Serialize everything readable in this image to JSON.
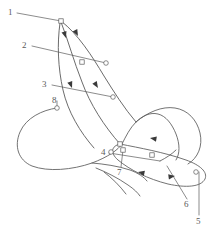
{
  "figure": {
    "kind": "scientific-line-diagram",
    "width": 220,
    "height": 236,
    "background_color": "#ffffff",
    "stroke_color": "#5a5a5a",
    "node_fill_color": "#ffffff",
    "arrow_fill_color": "#3a3a3a"
  },
  "callouts": [
    {
      "id": "1",
      "label": "1",
      "x": 8,
      "y": 8,
      "leader": "M 17 13 L 61 21"
    },
    {
      "id": "2",
      "label": "2",
      "x": 22,
      "y": 41,
      "leader": "M 32 46 L 106 63"
    },
    {
      "id": "3",
      "label": "3",
      "x": 42,
      "y": 80,
      "leader": "M 52 85 L 113 97"
    },
    {
      "id": "8",
      "label": "8",
      "x": 52,
      "y": 96,
      "leader": "M 57 101 L 57 108"
    },
    {
      "id": "4",
      "label": "4",
      "x": 101,
      "y": 148,
      "leader": "M 109 153 L 160 161"
    },
    {
      "id": "7",
      "label": "7",
      "x": 117,
      "y": 168,
      "leader": "M 121 167 L 123 150"
    },
    {
      "id": "6",
      "label": "6",
      "x": 184,
      "y": 200,
      "leader": "M 187 199 L 167 166"
    },
    {
      "id": "5",
      "label": "5",
      "x": 196,
      "y": 217,
      "leader": "M 199 215 L 199 172"
    }
  ],
  "paths": {
    "stroke_arc_outer": "M 61 21 C 78 34 92 56 104 76 C 114 92 124 108 136 122",
    "stroke_arc_inner": "M 61 22 C 68 40 74 62 82 82 C 90 104 104 126 120 144",
    "stroke_arc_left": "M 60 23 C 57 44 58 68 63 90 C 68 112 80 132 94 148",
    "wing_loop": "M 120 144 C 140 148 163 152 186 160 C 200 165 208 172 205 179 C 201 187 186 188 168 184 C 148 179 130 170 118 160 C 110 153 111 146 120 144 Z",
    "body_outline": "M 57 108 C 42 110 26 118 20 132 C 14 146 18 160 32 166 C 48 172 72 170 92 163 C 108 157 118 150 122 144",
    "head_outline": "M 122 144 C 126 136 130 128 136 122 C 142 116 150 112 158 114 C 166 116 172 124 176 134 C 180 144 180 154 176 160",
    "abdomen_outline": "M 136 122 C 148 112 162 106 175 108 C 188 110 197 120 200 133 C 203 146 198 158 188 164",
    "leg_1": "M 92 163 C 104 164 118 166 130 170 C 138 173 144 177 147 181",
    "leg_2": "M 96 168 C 106 172 118 178 128 185 C 134 189 138 193 140 196",
    "leg_3": "M 104 172 C 112 178 120 186 126 194",
    "antenna": "M 160 161 C 166 158 172 154 176 150"
  },
  "nodes": [
    {
      "id": "n-top",
      "x": 61,
      "y": 21,
      "shape": "square"
    },
    {
      "id": "n-mid-left",
      "x": 82,
      "y": 62,
      "shape": "square"
    },
    {
      "id": "n-mid-right",
      "x": 106,
      "y": 63,
      "shape": "circle"
    },
    {
      "id": "n-cross",
      "x": 113,
      "y": 97,
      "shape": "circle"
    },
    {
      "id": "n-wing-root",
      "x": 120,
      "y": 144,
      "shape": "square"
    },
    {
      "id": "n-wing-mid",
      "x": 152,
      "y": 155,
      "shape": "square"
    },
    {
      "id": "n-wing-tip",
      "x": 196,
      "y": 172,
      "shape": "circle"
    },
    {
      "id": "n-thorax",
      "x": 123,
      "y": 150,
      "shape": "square"
    },
    {
      "id": "n-leg-joint",
      "x": 111,
      "y": 152,
      "shape": "circle"
    },
    {
      "id": "n-body-top",
      "x": 57,
      "y": 108,
      "shape": "circle"
    }
  ],
  "arrowheads": [
    {
      "id": "a1",
      "x": 66,
      "y": 38,
      "angle": 72
    },
    {
      "id": "a2",
      "x": 78,
      "y": 36,
      "angle": 62
    },
    {
      "id": "a3",
      "x": 72,
      "y": 88,
      "angle": 70
    },
    {
      "id": "a4",
      "x": 98,
      "y": 88,
      "angle": 58
    },
    {
      "id": "a5",
      "x": 150,
      "y": 138,
      "angle": 190
    },
    {
      "id": "a6",
      "x": 175,
      "y": 176,
      "angle": 352
    },
    {
      "id": "a7",
      "x": 138,
      "y": 172,
      "angle": 192
    }
  ]
}
